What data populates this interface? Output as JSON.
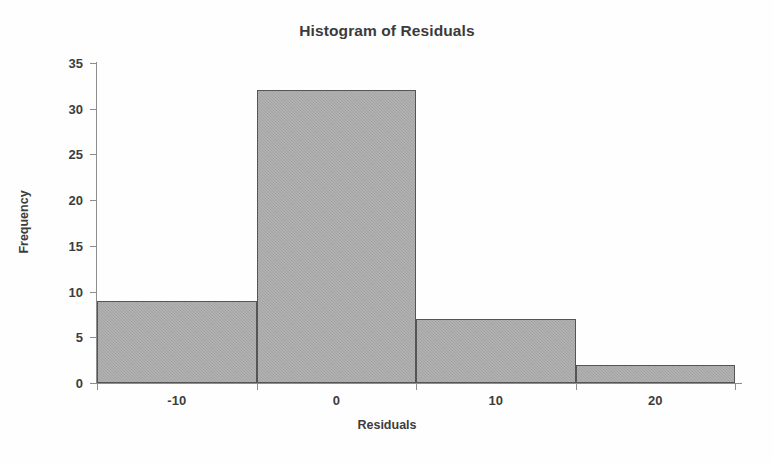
{
  "chart_data": {
    "type": "bar",
    "title": "Histogram of Residuals",
    "xlabel": "Residuals",
    "ylabel": "Frequency",
    "categories": [
      "-10",
      "0",
      "10",
      "20"
    ],
    "values": [
      9,
      32,
      7,
      2
    ],
    "bin_edges": [
      -15,
      -5,
      5,
      15,
      25
    ],
    "bin_centers": [
      -10,
      0,
      10,
      20
    ],
    "xlim": [
      -15,
      25
    ],
    "ylim": [
      0,
      35
    ],
    "y_ticks": [
      "0",
      "5",
      "10",
      "15",
      "20",
      "25",
      "30",
      "35"
    ],
    "y_tick_values": [
      0,
      5,
      10,
      15,
      20,
      25,
      30,
      35
    ],
    "x_ticks": [
      "-10",
      "0",
      "10",
      "20"
    ],
    "x_tick_values": [
      -10,
      0,
      10,
      20
    ],
    "grid": false,
    "legend": false,
    "bar_fill_color": "#a2a2a2",
    "bar_border_color": "#555555",
    "axis_color": "#8d8d8d",
    "text_color": "#3d3d3d",
    "background_color": "#fefefe"
  }
}
